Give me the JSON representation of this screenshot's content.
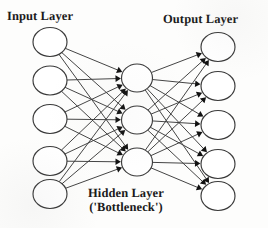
{
  "figure": {
    "background_color": "#fdfdfc",
    "stroke_color": "#3a3a3a",
    "node_fill": "#ffffff",
    "arrow_color": "#111111",
    "label_color": "#1b1b1b"
  },
  "labels": {
    "input": "Input Layer",
    "output": "Output Layer",
    "hidden_line1": "Hidden Layer",
    "hidden_line2": "('Bottleneck')"
  },
  "chart_data": {
    "type": "diagram",
    "layers": [
      {
        "name": "Input Layer",
        "label": "Input Layer",
        "count": 5,
        "cx": 50,
        "rx": 17,
        "ry": 14.5,
        "nodes_cy": [
          42,
          80.5,
          119,
          161,
          194
        ]
      },
      {
        "name": "Hidden Layer",
        "label": "Hidden Layer ('Bottleneck')",
        "count": 3,
        "cx": 137,
        "rx": 15.5,
        "ry": 14,
        "nodes_cy": [
          78,
          120,
          162
        ]
      },
      {
        "name": "Output Layer",
        "label": "Output Layer",
        "count": 5,
        "cx": 218,
        "rx": 17,
        "ry": 14.5,
        "nodes_cy": [
          47,
          86,
          125,
          164,
          196
        ]
      }
    ],
    "connections": [
      {
        "from_layer": 0,
        "to_layer": 1,
        "pattern": "fully-connected",
        "directed": true,
        "edge_count": 15
      },
      {
        "from_layer": 1,
        "to_layer": 2,
        "pattern": "fully-connected",
        "directed": true,
        "edge_count": 15
      }
    ],
    "legend": [],
    "grid": false
  }
}
